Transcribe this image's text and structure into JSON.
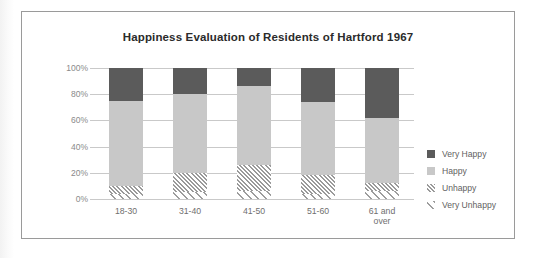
{
  "page": {
    "background_color": "#ffffff",
    "frame_border_color": "#9a9a9a"
  },
  "chart_data": {
    "type": "bar",
    "subtype": "stacked-percent",
    "title": "Happiness Evaluation of Residents of Hartford 1967",
    "xlabel": "",
    "ylabel": "",
    "ylim": [
      0,
      100
    ],
    "ytick_labels": [
      "100%",
      "80%",
      "60%",
      "40%",
      "20%",
      "0%"
    ],
    "ytick_values": [
      100,
      80,
      60,
      40,
      20,
      0
    ],
    "grid": true,
    "legend_position": "right",
    "categories": [
      "18-30",
      "31-40",
      "41-50",
      "51-60",
      "61 and over"
    ],
    "category_display": [
      [
        "18-30"
      ],
      [
        "31-40"
      ],
      [
        "41-50"
      ],
      [
        "51-60"
      ],
      [
        "61 and",
        "over"
      ]
    ],
    "series": [
      {
        "name": "Very Happy",
        "color": "#5b5b5b",
        "pattern": "solid",
        "values": [
          25,
          20,
          14,
          26,
          38
        ]
      },
      {
        "name": "Happy",
        "color": "#c8c8c8",
        "pattern": "solid",
        "values": [
          65,
          60,
          60,
          56,
          50
        ]
      },
      {
        "name": "Unhappy",
        "color": "#9a9a9a",
        "pattern": "diagonal-hatch",
        "values": [
          6,
          15,
          20,
          14,
          6
        ]
      },
      {
        "name": "Very Unhappy",
        "color": "#9d9d9d",
        "pattern": "sparse-diagonal-hatch",
        "values": [
          4,
          5,
          6,
          4,
          6
        ]
      }
    ],
    "stack_order_bottom_to_top": [
      "Very Unhappy",
      "Unhappy",
      "Happy",
      "Very Happy"
    ],
    "legend_entries": [
      {
        "label": "Very Happy",
        "color": "#5b5b5b",
        "pattern": "solid"
      },
      {
        "label": "Happy",
        "color": "#c8c8c8",
        "pattern": "solid"
      },
      {
        "label": "Unhappy",
        "color": "#9a9a9a",
        "pattern": "diagonal-hatch"
      },
      {
        "label": "Very Unhappy",
        "color": "#9d9d9d",
        "pattern": "sparse-diagonal-hatch"
      }
    ]
  }
}
